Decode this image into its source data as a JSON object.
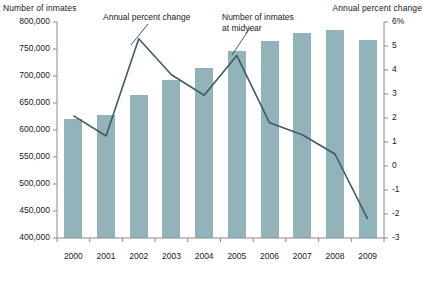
{
  "chart_data": {
    "type": "bar",
    "title": "",
    "categories": [
      "2000",
      "2001",
      "2002",
      "2003",
      "2004",
      "2005",
      "2006",
      "2007",
      "2008",
      "2009"
    ],
    "xlabel": "",
    "ylabel": "Number of inmates",
    "y2label": "Annual percent change",
    "ylim": [
      400000,
      800000
    ],
    "y2lim": [
      -3,
      6
    ],
    "grid": false,
    "legend_position": "annotations",
    "left_axis": {
      "label": "Number of inmates",
      "ticks": [
        800000,
        750000,
        700000,
        650000,
        600000,
        550000,
        500000,
        450000,
        400000
      ],
      "tick_labels": [
        "800,000",
        "750,000",
        "700,000",
        "650,000",
        "600,000",
        "550,000",
        "500,000",
        "450,000",
        "400,000"
      ]
    },
    "right_axis": {
      "label": "Annual percent change",
      "ticks": [
        6,
        5,
        4,
        3,
        2,
        1,
        0,
        -1,
        -2,
        -3
      ],
      "tick_labels": [
        "6%",
        "5",
        "4",
        "3",
        "2",
        "1",
        "0",
        "-1",
        "-2",
        "-3"
      ]
    },
    "series": [
      {
        "name": "Number of inmates at midyear",
        "type": "bar",
        "axis": "left",
        "color": "#92b3b9",
        "values": [
          620000,
          628000,
          665000,
          692000,
          715000,
          747000,
          765000,
          780000,
          785000,
          767000
        ]
      },
      {
        "name": "Annual percent change",
        "type": "line",
        "axis": "right",
        "color": "#3d5c63",
        "values": [
          2.1,
          1.25,
          5.3,
          3.8,
          2.95,
          4.6,
          1.8,
          1.3,
          0.5,
          -2.2
        ]
      }
    ],
    "annotations": [
      {
        "name": "annual-percent-change",
        "text": "Annual percent change"
      },
      {
        "name": "number-of-inmates-at-midyear",
        "line1": "Number of inmates",
        "line2": "at midyear"
      }
    ]
  },
  "colors": {
    "bar": "#92b3b9",
    "line": "#3d5c63",
    "axis": "#8a8a8a",
    "text": "#1a1a1a",
    "background": "#ffffff"
  }
}
